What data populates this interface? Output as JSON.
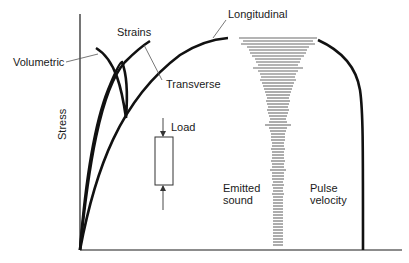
{
  "diagram": {
    "axis": {
      "y_label": "Stress"
    },
    "labels": {
      "strains": "Strains",
      "longitudinal": "Longitudinal",
      "transverse": "Transverse",
      "volumetric": "Volumetric",
      "load": "Load",
      "emitted_sound_line1": "Emitted",
      "emitted_sound_line2": "sound",
      "pulse_velocity_line1": "Pulse",
      "pulse_velocity_line2": "velocity"
    },
    "curves": [
      "Longitudinal",
      "Transverse",
      "Volumetric",
      "Pulse velocity"
    ],
    "emitted_sound_bars": [
      {
        "y": 38,
        "w": 78
      },
      {
        "y": 41,
        "w": 70
      },
      {
        "y": 44,
        "w": 74
      },
      {
        "y": 47,
        "w": 62
      },
      {
        "y": 50,
        "w": 58
      },
      {
        "y": 53,
        "w": 56
      },
      {
        "y": 56,
        "w": 52
      },
      {
        "y": 59,
        "w": 46
      },
      {
        "y": 62,
        "w": 44
      },
      {
        "y": 65,
        "w": 40
      },
      {
        "y": 68,
        "w": 50
      },
      {
        "y": 71,
        "w": 40
      },
      {
        "y": 74,
        "w": 36
      },
      {
        "y": 77,
        "w": 34
      },
      {
        "y": 80,
        "w": 36
      },
      {
        "y": 83,
        "w": 32
      },
      {
        "y": 86,
        "w": 30
      },
      {
        "y": 89,
        "w": 28
      },
      {
        "y": 92,
        "w": 26
      },
      {
        "y": 95,
        "w": 24
      },
      {
        "y": 98,
        "w": 22
      },
      {
        "y": 101,
        "w": 24
      },
      {
        "y": 104,
        "w": 22
      },
      {
        "y": 107,
        "w": 20
      },
      {
        "y": 110,
        "w": 22
      },
      {
        "y": 113,
        "w": 20
      },
      {
        "y": 116,
        "w": 18
      },
      {
        "y": 119,
        "w": 16
      },
      {
        "y": 122,
        "w": 18
      },
      {
        "y": 125,
        "w": 26
      },
      {
        "y": 128,
        "w": 18
      },
      {
        "y": 131,
        "w": 16
      },
      {
        "y": 134,
        "w": 14
      },
      {
        "y": 137,
        "w": 14
      },
      {
        "y": 140,
        "w": 14
      },
      {
        "y": 143,
        "w": 12
      },
      {
        "y": 146,
        "w": 12
      },
      {
        "y": 149,
        "w": 14
      },
      {
        "y": 152,
        "w": 12
      },
      {
        "y": 155,
        "w": 12
      },
      {
        "y": 158,
        "w": 12
      },
      {
        "y": 161,
        "w": 14
      },
      {
        "y": 164,
        "w": 12
      },
      {
        "y": 167,
        "w": 12
      },
      {
        "y": 170,
        "w": 16
      },
      {
        "y": 173,
        "w": 12
      },
      {
        "y": 176,
        "w": 12
      },
      {
        "y": 179,
        "w": 12
      },
      {
        "y": 182,
        "w": 10
      },
      {
        "y": 185,
        "w": 12
      },
      {
        "y": 188,
        "w": 10
      },
      {
        "y": 191,
        "w": 10
      },
      {
        "y": 194,
        "w": 12
      },
      {
        "y": 197,
        "w": 10
      },
      {
        "y": 200,
        "w": 10
      },
      {
        "y": 203,
        "w": 10
      },
      {
        "y": 206,
        "w": 10
      },
      {
        "y": 209,
        "w": 10
      },
      {
        "y": 212,
        "w": 10
      },
      {
        "y": 215,
        "w": 10
      },
      {
        "y": 218,
        "w": 10
      },
      {
        "y": 221,
        "w": 10
      },
      {
        "y": 224,
        "w": 10
      },
      {
        "y": 227,
        "w": 10
      },
      {
        "y": 230,
        "w": 10
      },
      {
        "y": 233,
        "w": 10
      },
      {
        "y": 236,
        "w": 10
      },
      {
        "y": 239,
        "w": 10
      },
      {
        "y": 242,
        "w": 10
      },
      {
        "y": 245,
        "w": 10
      }
    ],
    "colors": {
      "ink": "#1a1a1a",
      "leader": "#555555",
      "bars": "#6a6a6a"
    }
  }
}
